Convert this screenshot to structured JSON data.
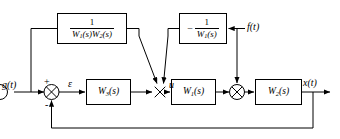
{
  "diagram": {
    "line_color": "#000000",
    "background": "#ffffff"
  },
  "signals": {
    "input": "g(t)",
    "error": "ε",
    "control": "u",
    "disturbance": "f(t)",
    "output": "x(t)"
  },
  "signs": {
    "plus": "+",
    "minus": "-"
  },
  "blocks": {
    "feedforward_g": {
      "name": "1/(W1(s)W2(s))",
      "numerator": "1",
      "denominator_w1": "W",
      "denominator_w1_sub": "1",
      "denominator_w1_arg": "(s)",
      "denominator_w2": "W",
      "denominator_w2_sub": "2",
      "denominator_w2_arg": "(s)"
    },
    "feedforward_f": {
      "name": "-1/W1(s)",
      "sign": "−",
      "numerator": "1",
      "denominator": "W",
      "denominator_sub": "1",
      "denominator_arg": "(s)"
    },
    "controller": {
      "name": "W3(s)",
      "symbol": "W",
      "subscript": "3",
      "arg": "(s)"
    },
    "plant_1": {
      "name": "W1(s)",
      "symbol": "W",
      "subscript": "1",
      "arg": "(s)"
    },
    "plant_2": {
      "name": "W2(s)",
      "symbol": "W",
      "subscript": "2",
      "arg": "(s)"
    }
  },
  "junctions": {
    "error_summer": "summing-junction-error",
    "control_summer": "summing-junction-control",
    "disturbance_summer": "summing-junction-disturbance"
  }
}
